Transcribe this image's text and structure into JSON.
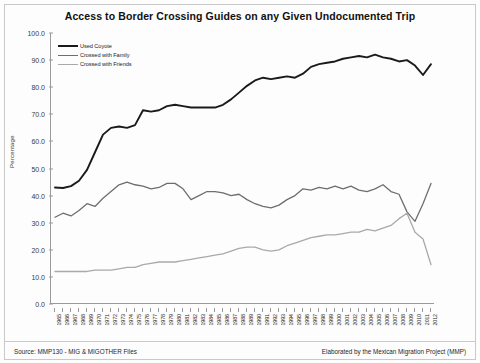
{
  "chart_data": {
    "type": "line",
    "title": "Access to Border Crossing Guides on any Given Undocumented Trip",
    "xlabel": "",
    "ylabel": "Percentage",
    "ylim": [
      0,
      100
    ],
    "yticks": [
      "0.0",
      "10.0",
      "20.0",
      "30.0",
      "40.0",
      "50.0",
      "60.0",
      "70.0",
      "80.0",
      "90.0",
      "100.0"
    ],
    "grid": false,
    "legend_position": "top-left",
    "x": [
      1965,
      1966,
      1967,
      1968,
      1969,
      1970,
      1971,
      1972,
      1973,
      1974,
      1975,
      1976,
      1977,
      1978,
      1979,
      1980,
      1981,
      1982,
      1983,
      1984,
      1985,
      1986,
      1987,
      1988,
      1989,
      1990,
      1991,
      1992,
      1993,
      1994,
      1995,
      1996,
      1997,
      1998,
      1999,
      2000,
      2001,
      2002,
      2003,
      2004,
      2005,
      2006,
      2007,
      2008,
      2009,
      2010,
      2011,
      2012
    ],
    "categories": [
      "1965",
      "1966",
      "1967",
      "1968",
      "1969",
      "1970",
      "1971",
      "1972",
      "1973",
      "1974",
      "1975",
      "1976",
      "1977",
      "1978",
      "1979",
      "1980",
      "1981",
      "1982",
      "1983",
      "1984",
      "1985",
      "1986",
      "1987",
      "1988",
      "1989",
      "1990",
      "1991",
      "1992",
      "1993",
      "1994",
      "1995",
      "1996",
      "1997",
      "1998",
      "1999",
      "2000",
      "2001",
      "2002",
      "2003",
      "2004",
      "2005",
      "2006",
      "2007",
      "2008",
      "2009",
      "2010",
      "2011",
      "2012"
    ],
    "series": [
      {
        "name": "Used Coyote",
        "color": "#1a1a1a",
        "width": 1.9,
        "values": [
          43.0,
          42.8,
          43.5,
          45.5,
          49.5,
          56.0,
          62.5,
          65.0,
          65.5,
          65.0,
          66.0,
          71.5,
          71.0,
          71.5,
          73.0,
          73.5,
          73.0,
          72.5,
          72.5,
          72.5,
          72.5,
          73.5,
          75.5,
          78.0,
          80.5,
          82.5,
          83.5,
          83.0,
          83.5,
          84.0,
          83.5,
          85.0,
          87.5,
          88.5,
          89.0,
          89.5,
          90.5,
          91.0,
          91.5,
          91.0,
          92.0,
          91.0,
          90.5,
          89.5,
          90.0,
          88.0,
          84.5,
          88.5
        ]
      },
      {
        "name": "Crossed with Family",
        "color": "#6e6e6e",
        "width": 1.3,
        "values": [
          32.0,
          33.5,
          32.5,
          34.5,
          37.0,
          36.0,
          39.0,
          41.5,
          44.0,
          45.0,
          44.0,
          43.5,
          42.5,
          43.0,
          44.5,
          44.5,
          42.5,
          38.5,
          40.0,
          41.5,
          41.5,
          41.0,
          40.0,
          40.5,
          38.5,
          37.0,
          36.0,
          35.5,
          36.5,
          38.5,
          40.0,
          42.5,
          42.0,
          43.0,
          42.5,
          43.5,
          42.5,
          43.5,
          42.0,
          41.5,
          42.5,
          44.0,
          41.5,
          40.5,
          34.0,
          30.5,
          37.0,
          44.5
        ]
      },
      {
        "name": "Crossed with Friends",
        "color": "#a9a9a9",
        "width": 1.3,
        "values": [
          12.0,
          12.0,
          12.0,
          12.0,
          12.0,
          12.5,
          12.5,
          12.5,
          13.0,
          13.5,
          13.5,
          14.5,
          15.0,
          15.5,
          15.5,
          15.5,
          16.0,
          16.5,
          17.0,
          17.5,
          18.0,
          18.5,
          19.5,
          20.5,
          21.0,
          21.0,
          20.0,
          19.5,
          20.0,
          21.5,
          22.5,
          23.5,
          24.5,
          25.0,
          25.5,
          25.5,
          26.0,
          26.5,
          26.5,
          27.5,
          27.0,
          28.0,
          29.0,
          31.5,
          33.5,
          26.5,
          24.0,
          14.5
        ]
      }
    ]
  },
  "footer": {
    "source": "Source: MMP130 - MIG & MIGOTHER Files",
    "credit": "Elaborated by the Mexican Migration Project (MMP)"
  }
}
